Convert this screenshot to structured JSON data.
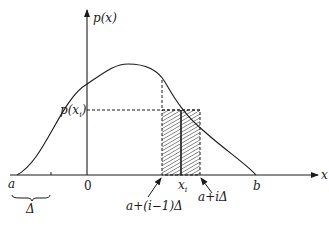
{
  "diagram": {
    "type": "probability density with Riemann-sum strip",
    "axes": {
      "x_label": "x",
      "y_label": "p(x)",
      "origin_label": "0"
    },
    "points": {
      "a_label": "a",
      "b_label": "b",
      "xi_label": "x",
      "xi_sub": "i",
      "p_xi_label": "p(x",
      "p_xi_sub": "i",
      "p_xi_close": ")"
    },
    "annotations": {
      "left_edge": "a+(i−1)Δ",
      "right_edge": "a+iΔ",
      "delta_brace": "Δ"
    },
    "colors": {
      "ink": "#1a1a1a",
      "background": "#ffffff"
    }
  }
}
